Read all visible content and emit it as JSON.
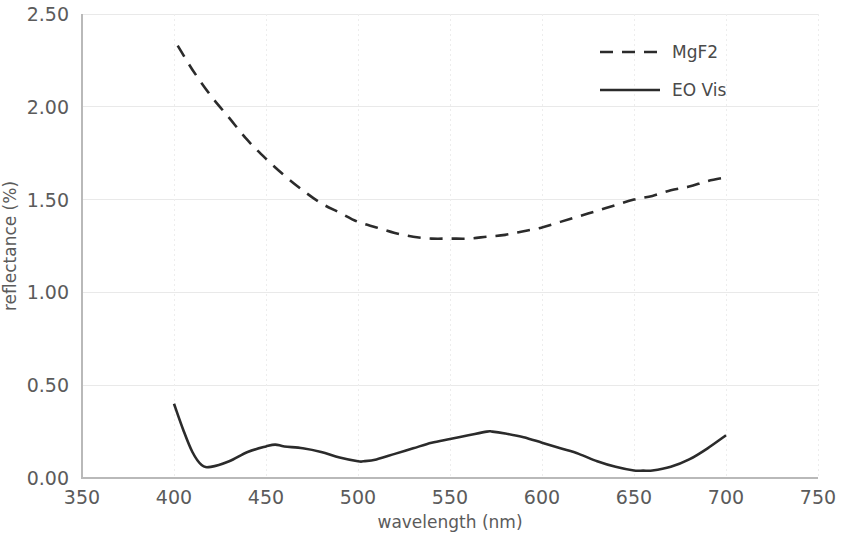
{
  "chart_data": {
    "type": "line",
    "title": "",
    "xlabel": "wavelength (nm)",
    "ylabel": "reflectance (%)",
    "xlim": [
      350,
      750
    ],
    "ylim": [
      0.0,
      2.5
    ],
    "xticks": [
      350,
      400,
      450,
      500,
      550,
      600,
      650,
      700,
      750
    ],
    "xtick_labels": [
      "350",
      "400",
      "450",
      "500",
      "550",
      "600",
      "650",
      "700",
      "750"
    ],
    "yticks": [
      0.0,
      0.5,
      1.0,
      1.5,
      2.0,
      2.5
    ],
    "ytick_labels": [
      "0.00",
      "0.50",
      "1.00",
      "1.50",
      "2.00",
      "2.50"
    ],
    "grid": true,
    "legend_position": "upper right",
    "line_color": "#2b2b2b",
    "grid_color": "#e9e9e9",
    "series": [
      {
        "name": "MgF2",
        "style": "dashed",
        "x": [
          402,
          410,
          420,
          430,
          440,
          450,
          460,
          470,
          480,
          490,
          500,
          510,
          520,
          530,
          540,
          550,
          560,
          570,
          580,
          590,
          600,
          610,
          620,
          630,
          640,
          650,
          660,
          670,
          680,
          690,
          700
        ],
        "y": [
          2.33,
          2.2,
          2.06,
          1.94,
          1.82,
          1.72,
          1.63,
          1.55,
          1.48,
          1.43,
          1.38,
          1.35,
          1.32,
          1.3,
          1.29,
          1.29,
          1.29,
          1.3,
          1.31,
          1.33,
          1.35,
          1.38,
          1.41,
          1.44,
          1.47,
          1.5,
          1.52,
          1.55,
          1.57,
          1.6,
          1.62
        ]
      },
      {
        "name": "EO Vis",
        "style": "solid",
        "x": [
          400,
          405,
          410,
          415,
          420,
          430,
          440,
          450,
          455,
          460,
          470,
          480,
          490,
          500,
          503,
          510,
          520,
          530,
          540,
          550,
          560,
          570,
          573,
          580,
          590,
          600,
          610,
          620,
          630,
          640,
          650,
          655,
          660,
          670,
          680,
          690,
          700
        ],
        "y": [
          0.4,
          0.26,
          0.14,
          0.07,
          0.06,
          0.09,
          0.14,
          0.17,
          0.18,
          0.17,
          0.16,
          0.14,
          0.11,
          0.09,
          0.09,
          0.1,
          0.13,
          0.16,
          0.19,
          0.21,
          0.23,
          0.25,
          0.25,
          0.24,
          0.22,
          0.19,
          0.16,
          0.13,
          0.09,
          0.06,
          0.04,
          0.04,
          0.04,
          0.06,
          0.1,
          0.16,
          0.23
        ]
      }
    ]
  },
  "legend": {
    "items": [
      {
        "label": "MgF2",
        "style": "dashed"
      },
      {
        "label": "EO Vis",
        "style": "solid"
      }
    ]
  }
}
